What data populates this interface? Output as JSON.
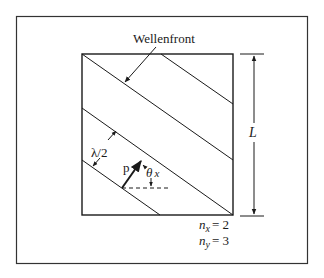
{
  "diagram": {
    "title_label": "Wellenfront",
    "length_label": "L",
    "half_wavelength_label": "λ/2",
    "momentum_label": "p",
    "angle_label": "θ",
    "angle_subscript": "x",
    "nx_label": "n",
    "nx_subscript": "x",
    "nx_value": "= 2",
    "ny_label": "n",
    "ny_subscript": "y",
    "ny_value": "= 3",
    "nx": 2,
    "ny": 3,
    "colors": {
      "line": "#1a1a1a",
      "frame": "#333333",
      "background": "#ffffff"
    }
  }
}
